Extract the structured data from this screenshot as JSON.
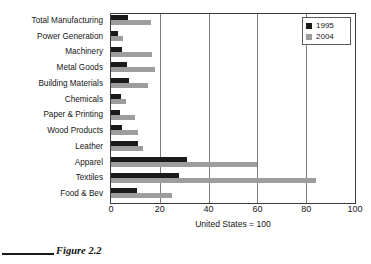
{
  "figure": {
    "caption": "Figure 2.2"
  },
  "legend": {
    "position": "top-right",
    "entries": [
      {
        "label": "1995",
        "color": "#1a1a1a"
      },
      {
        "label": "2004",
        "color": "#9d9d9d"
      }
    ]
  },
  "chart_data": {
    "type": "bar",
    "orientation": "horizontal",
    "title": "",
    "xlabel": "United States = 100",
    "ylabel": "",
    "xlim": [
      0,
      100
    ],
    "xticks": [
      0,
      20,
      40,
      60,
      80,
      100
    ],
    "xtick_labels": [
      "0",
      "20",
      "40",
      "60",
      "80",
      "100"
    ],
    "grid": "vertical",
    "legend": [
      "1995",
      "2004"
    ],
    "categories": [
      "Total Manufacturing",
      "Power Generation",
      "Machinery",
      "Metal Goods",
      "Building Materials",
      "Chemicals",
      "Paper & Printing",
      "Wood Products",
      "Leather",
      "Apparel",
      "Textiles",
      "Food & Bev"
    ],
    "series": [
      {
        "name": "1995",
        "color": "#1a1a1a",
        "values": [
          7,
          3,
          4.5,
          6.5,
          7.5,
          4,
          3.5,
          4.5,
          11,
          31,
          28,
          10.5
        ]
      },
      {
        "name": "2004",
        "color": "#9d9d9d",
        "values": [
          16.5,
          5,
          17,
          18,
          15,
          6,
          10,
          11,
          13,
          60,
          84,
          25
        ]
      }
    ]
  }
}
